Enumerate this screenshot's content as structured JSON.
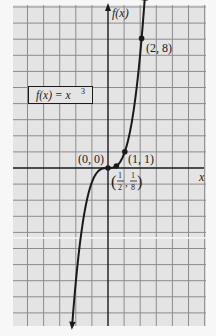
{
  "chart_data": {
    "type": "line",
    "title": "",
    "function_label": "f(x) = x³",
    "function_label_parts": {
      "lhs": "f(x) = x",
      "exponent": "3"
    },
    "xlabel": "x",
    "ylabel": "f(x)",
    "xlim": [
      -5.9,
      6.0
    ],
    "ylim": [
      -9.8,
      10.0
    ],
    "grid": true,
    "series": [
      {
        "name": "f(x) = x^3",
        "expression": "x^3",
        "x_range": [
          -2.14,
          2.2
        ],
        "arrows": "both"
      }
    ],
    "points": [
      {
        "x": 2,
        "y": 8,
        "label": "(2, 8)"
      },
      {
        "x": 1,
        "y": 1,
        "label": "(1, 1)"
      },
      {
        "x": 0.5,
        "y": 0.125,
        "label": "(1/2, 1/8)"
      },
      {
        "x": 0,
        "y": 0,
        "label": "(0, 0)"
      }
    ]
  },
  "labels": {
    "y_axis": "f(x)",
    "x_axis": "x",
    "box": "f(x) = x",
    "box_exp": "3",
    "p_2_8": "(2, 8)",
    "p_1_1": "(1, 1)",
    "p_0_0": "(0, 0)",
    "p_half_num1": "1",
    "p_half_den1": "2",
    "p_half_num2": "1",
    "p_half_den2": "8"
  },
  "colors": {
    "paper": "#e4e4e4",
    "grid": "#8c8c8c",
    "axis": "#1a1a1a",
    "curve": "#1a1a1a"
  }
}
